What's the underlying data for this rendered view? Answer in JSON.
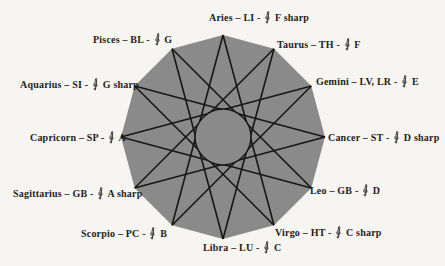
{
  "diagram": {
    "type": "dodecagram-star",
    "points": 12,
    "star_step": 5,
    "colors": {
      "background": "#f6f5f1",
      "polygon_fill": "#8a8a8a",
      "line": "#171717",
      "text": "#1f1d1b"
    },
    "separators": {
      "sign_organ": "–",
      "organ_note": "-"
    },
    "clef_icon": "treble-clef",
    "labels": [
      {
        "sign": "Aries",
        "organ": "LI",
        "note": "F sharp"
      },
      {
        "sign": "Taurus",
        "organ": "TH",
        "note": "F"
      },
      {
        "sign": "Gemini",
        "organ": "LV, LR",
        "note": "E"
      },
      {
        "sign": "Cancer",
        "organ": "ST",
        "note": "D sharp"
      },
      {
        "sign": "Leo",
        "organ": "GB",
        "note": "D"
      },
      {
        "sign": "Virgo",
        "organ": "HT",
        "note": "C sharp"
      },
      {
        "sign": "Libra",
        "organ": "LU",
        "note": "C"
      },
      {
        "sign": "Scorpio",
        "organ": "PC",
        "note": "B"
      },
      {
        "sign": "Sagittarius",
        "organ": "GB",
        "note": "A sharp"
      },
      {
        "sign": "Capricorn",
        "organ": "SP",
        "note": "A"
      },
      {
        "sign": "Aquarius",
        "organ": "SI",
        "note": "G sharp"
      },
      {
        "sign": "Pisces",
        "organ": "BL",
        "note": "G"
      }
    ]
  }
}
